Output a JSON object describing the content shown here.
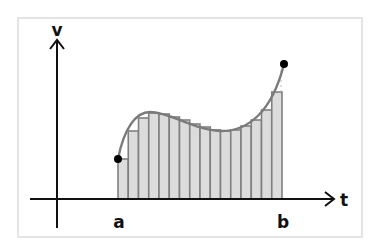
{
  "figure": {
    "type": "riemann-sum-diagram",
    "labels": {
      "y_axis": "v",
      "x_axis": "t",
      "left_bound": "a",
      "right_bound": "b"
    },
    "colors": {
      "frame": "#e4e4e4",
      "axis": "#111111",
      "curve": "#7a7a7a",
      "bar_fill": "#dcdcdc",
      "bar_stroke": "#808080",
      "point": "#000000",
      "dashed_gap": "#bdbdbd"
    },
    "rectangles": {
      "count": 16,
      "method": "left-endpoint",
      "x_start_px": 118,
      "x_end_px": 282,
      "baseline_px": 199,
      "top_px": [
        159,
        131,
        118,
        113,
        114,
        117,
        120,
        124,
        127,
        130,
        131,
        130,
        126,
        120,
        110,
        92
      ]
    },
    "endpoints": [
      {
        "label": "a",
        "x_px": 118,
        "y_px": 159
      },
      {
        "label": "b",
        "x_px": 284,
        "y_px": 64
      }
    ]
  }
}
